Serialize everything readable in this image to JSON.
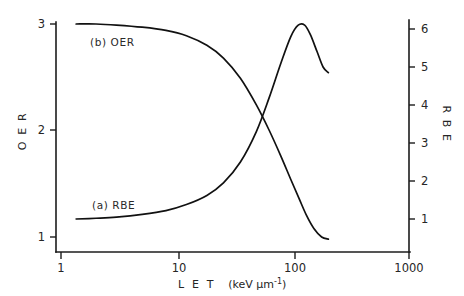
{
  "figure": {
    "background": "#ffffff",
    "ink_color": "#111111"
  },
  "chart_data": {
    "type": "line",
    "title": "",
    "xlabel_parts": {
      "name": "L E T",
      "units_open": "(keV μm",
      "units_exp": "-1",
      "units_close": ")"
    },
    "xlabel": "L E T  (keV μm-1)",
    "xscale": "log",
    "xlim": [
      1,
      1000
    ],
    "xticks": [
      1,
      10,
      100,
      1000
    ],
    "xticklabels": [
      "1",
      "10",
      "100",
      "1000"
    ],
    "grid": false,
    "legend_position": "inline-annotations",
    "left_axis": {
      "label": "O E R",
      "ylim": [
        1,
        3
      ],
      "yticks": [
        1,
        2,
        3
      ],
      "yticklabels": [
        "1",
        "2",
        "3"
      ]
    },
    "right_axis": {
      "label": "R B E",
      "ylim": [
        0.5,
        6.45
      ],
      "yticks": [
        1,
        2,
        3,
        4,
        5,
        6
      ],
      "yticklabels": [
        "1",
        "2",
        "3",
        "4",
        "5",
        "6"
      ]
    },
    "annotations": [
      {
        "text": "(b) OER",
        "x_let": 2.8,
        "axis": "left"
      },
      {
        "text": "(a) RBE",
        "x_let": 3.0,
        "axis": "right"
      }
    ],
    "series": [
      {
        "name": "(b) OER",
        "axis": "left",
        "ylabel": "O E R",
        "x": [
          1.35,
          2,
          3,
          5,
          8,
          12,
          18,
          25,
          35,
          48,
          62,
          78,
          95,
          112,
          130,
          150,
          175,
          200
        ],
        "y": [
          3.0,
          3.0,
          2.99,
          2.97,
          2.94,
          2.89,
          2.8,
          2.68,
          2.49,
          2.24,
          2.0,
          1.76,
          1.54,
          1.36,
          1.2,
          1.08,
          1.0,
          0.98
        ]
      },
      {
        "name": "(a) RBE",
        "axis": "right",
        "ylabel": "R B E",
        "x": [
          1.35,
          2,
          3,
          5,
          8,
          12,
          18,
          25,
          35,
          48,
          62,
          78,
          95,
          110,
          125,
          140,
          160,
          180,
          200
        ],
        "y": [
          1.0,
          1.02,
          1.05,
          1.12,
          1.22,
          1.38,
          1.62,
          1.95,
          2.5,
          3.3,
          4.2,
          5.1,
          5.8,
          6.1,
          6.1,
          5.85,
          5.4,
          5.0,
          4.85
        ]
      }
    ]
  }
}
